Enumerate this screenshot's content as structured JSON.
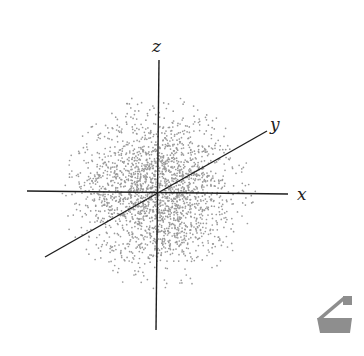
{
  "diagram": {
    "title": "",
    "axes": {
      "x": {
        "label": "x",
        "from": [
          27,
          191
        ],
        "to": [
          288,
          194
        ],
        "label_pos": [
          297,
          200
        ]
      },
      "y": {
        "label": "y",
        "from": [
          45,
          257
        ],
        "to": [
          267,
          131
        ],
        "label_pos": [
          270,
          130
        ]
      },
      "z": {
        "label": "z",
        "from": [
          156,
          330
        ],
        "to": [
          159,
          60
        ],
        "label_pos": [
          152,
          52
        ]
      }
    },
    "origin": [
      158,
      192
    ],
    "cloud": {
      "center": [
        158,
        192
      ],
      "sigma": 38,
      "max_radius": 98,
      "count": 2200,
      "dot_color": "#9a9a9a",
      "dot_radius": 0.85,
      "seed": 12345
    },
    "axis_color": "#1e1e1e",
    "icon": {
      "name": "paint-bucket-icon",
      "color": "#8e8e8e"
    }
  }
}
